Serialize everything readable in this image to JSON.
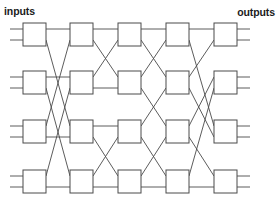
{
  "figure": {
    "type": "network-diagram",
    "name": "benes-switching-network",
    "background_color": "#ffffff",
    "line_color": "#4a4a4a",
    "text_color": "#1b1b1b"
  },
  "labels": {
    "inputs": "inputs",
    "outputs": "outputs"
  },
  "geometry": {
    "canvas_width": 279,
    "canvas_height": 205,
    "box_width": 23,
    "box_height": 23,
    "column_x": [
      23,
      70,
      118,
      166,
      214
    ],
    "row_y": [
      23,
      71,
      120,
      170
    ],
    "port_offset_top": 6,
    "port_offset_bottom": 17,
    "stub_length": 13
  },
  "stages": [
    {
      "index": 1,
      "label": "stage-1",
      "switch_count": 4
    },
    {
      "index": 2,
      "label": "stage-2",
      "switch_count": 4
    },
    {
      "index": 3,
      "label": "stage-3",
      "switch_count": 4
    },
    {
      "index": 4,
      "label": "stage-4",
      "switch_count": 4
    },
    {
      "index": 5,
      "label": "stage-5",
      "switch_count": 4
    }
  ],
  "switches": [
    {
      "id": "sw-1-1",
      "stage": 1,
      "row": 1
    },
    {
      "id": "sw-1-2",
      "stage": 1,
      "row": 2
    },
    {
      "id": "sw-1-3",
      "stage": 1,
      "row": 3
    },
    {
      "id": "sw-1-4",
      "stage": 1,
      "row": 4
    },
    {
      "id": "sw-2-1",
      "stage": 2,
      "row": 1
    },
    {
      "id": "sw-2-2",
      "stage": 2,
      "row": 2
    },
    {
      "id": "sw-2-3",
      "stage": 2,
      "row": 3
    },
    {
      "id": "sw-2-4",
      "stage": 2,
      "row": 4
    },
    {
      "id": "sw-3-1",
      "stage": 3,
      "row": 1
    },
    {
      "id": "sw-3-2",
      "stage": 3,
      "row": 2
    },
    {
      "id": "sw-3-3",
      "stage": 3,
      "row": 3
    },
    {
      "id": "sw-3-4",
      "stage": 3,
      "row": 4
    },
    {
      "id": "sw-4-1",
      "stage": 4,
      "row": 1
    },
    {
      "id": "sw-4-2",
      "stage": 4,
      "row": 2
    },
    {
      "id": "sw-4-3",
      "stage": 4,
      "row": 3
    },
    {
      "id": "sw-4-4",
      "stage": 4,
      "row": 4
    },
    {
      "id": "sw-5-1",
      "stage": 5,
      "row": 1
    },
    {
      "id": "sw-5-2",
      "stage": 5,
      "row": 2
    },
    {
      "id": "sw-5-3",
      "stage": 5,
      "row": 3
    },
    {
      "id": "sw-5-4",
      "stage": 5,
      "row": 4
    }
  ],
  "input_ports": [
    {
      "id": "in-1",
      "row": 1,
      "port": "top"
    },
    {
      "id": "in-2",
      "row": 1,
      "port": "bottom"
    },
    {
      "id": "in-3",
      "row": 2,
      "port": "top"
    },
    {
      "id": "in-4",
      "row": 2,
      "port": "bottom"
    },
    {
      "id": "in-5",
      "row": 3,
      "port": "top"
    },
    {
      "id": "in-6",
      "row": 3,
      "port": "bottom"
    },
    {
      "id": "in-7",
      "row": 4,
      "port": "top"
    },
    {
      "id": "in-8",
      "row": 4,
      "port": "bottom"
    }
  ],
  "output_ports": [
    {
      "id": "out-1",
      "row": 1,
      "port": "top"
    },
    {
      "id": "out-2",
      "row": 1,
      "port": "bottom"
    },
    {
      "id": "out-3",
      "row": 2,
      "port": "top"
    },
    {
      "id": "out-4",
      "row": 2,
      "port": "bottom"
    },
    {
      "id": "out-5",
      "row": 3,
      "port": "top"
    },
    {
      "id": "out-6",
      "row": 3,
      "port": "bottom"
    },
    {
      "id": "out-7",
      "row": 4,
      "port": "top"
    },
    {
      "id": "out-8",
      "row": 4,
      "port": "bottom"
    }
  ],
  "links": [
    {
      "from_stage": 1,
      "from_row": 1,
      "from_port": "top",
      "to_row": 1,
      "to_port": "top"
    },
    {
      "from_stage": 1,
      "from_row": 1,
      "from_port": "bottom",
      "to_row": 3,
      "to_port": "top"
    },
    {
      "from_stage": 1,
      "from_row": 2,
      "from_port": "top",
      "to_row": 2,
      "to_port": "top"
    },
    {
      "from_stage": 1,
      "from_row": 2,
      "from_port": "bottom",
      "to_row": 4,
      "to_port": "top"
    },
    {
      "from_stage": 1,
      "from_row": 3,
      "from_port": "top",
      "to_row": 1,
      "to_port": "bottom"
    },
    {
      "from_stage": 1,
      "from_row": 3,
      "from_port": "bottom",
      "to_row": 3,
      "to_port": "bottom"
    },
    {
      "from_stage": 1,
      "from_row": 4,
      "from_port": "top",
      "to_row": 2,
      "to_port": "bottom"
    },
    {
      "from_stage": 1,
      "from_row": 4,
      "from_port": "bottom",
      "to_row": 4,
      "to_port": "bottom"
    },
    {
      "from_stage": 2,
      "from_row": 1,
      "from_port": "top",
      "to_row": 1,
      "to_port": "top"
    },
    {
      "from_stage": 2,
      "from_row": 1,
      "from_port": "bottom",
      "to_row": 2,
      "to_port": "top"
    },
    {
      "from_stage": 2,
      "from_row": 2,
      "from_port": "top",
      "to_row": 1,
      "to_port": "bottom"
    },
    {
      "from_stage": 2,
      "from_row": 2,
      "from_port": "bottom",
      "to_row": 2,
      "to_port": "bottom"
    },
    {
      "from_stage": 2,
      "from_row": 3,
      "from_port": "top",
      "to_row": 3,
      "to_port": "top"
    },
    {
      "from_stage": 2,
      "from_row": 3,
      "from_port": "bottom",
      "to_row": 4,
      "to_port": "top"
    },
    {
      "from_stage": 2,
      "from_row": 4,
      "from_port": "top",
      "to_row": 3,
      "to_port": "bottom"
    },
    {
      "from_stage": 2,
      "from_row": 4,
      "from_port": "bottom",
      "to_row": 4,
      "to_port": "bottom"
    },
    {
      "from_stage": 3,
      "from_row": 1,
      "from_port": "top",
      "to_row": 1,
      "to_port": "top"
    },
    {
      "from_stage": 3,
      "from_row": 1,
      "from_port": "bottom",
      "to_row": 2,
      "to_port": "top"
    },
    {
      "from_stage": 3,
      "from_row": 2,
      "from_port": "top",
      "to_row": 1,
      "to_port": "bottom"
    },
    {
      "from_stage": 3,
      "from_row": 2,
      "from_port": "bottom",
      "to_row": 3,
      "to_port": "top"
    },
    {
      "from_stage": 3,
      "from_row": 3,
      "from_port": "top",
      "to_row": 2,
      "to_port": "bottom"
    },
    {
      "from_stage": 3,
      "from_row": 3,
      "from_port": "bottom",
      "to_row": 4,
      "to_port": "top"
    },
    {
      "from_stage": 3,
      "from_row": 4,
      "from_port": "top",
      "to_row": 3,
      "to_port": "bottom"
    },
    {
      "from_stage": 3,
      "from_row": 4,
      "from_port": "bottom",
      "to_row": 4,
      "to_port": "bottom"
    },
    {
      "from_stage": 4,
      "from_row": 1,
      "from_port": "top",
      "to_row": 1,
      "to_port": "top"
    },
    {
      "from_stage": 4,
      "from_row": 1,
      "from_port": "bottom",
      "to_row": 3,
      "to_port": "top"
    },
    {
      "from_stage": 4,
      "from_row": 2,
      "from_port": "top",
      "to_row": 1,
      "to_port": "bottom"
    },
    {
      "from_stage": 4,
      "from_row": 2,
      "from_port": "bottom",
      "to_row": 3,
      "to_port": "bottom"
    },
    {
      "from_stage": 4,
      "from_row": 3,
      "from_port": "top",
      "to_row": 2,
      "to_port": "top"
    },
    {
      "from_stage": 4,
      "from_row": 3,
      "from_port": "bottom",
      "to_row": 4,
      "to_port": "top"
    },
    {
      "from_stage": 4,
      "from_row": 4,
      "from_port": "top",
      "to_row": 2,
      "to_port": "bottom"
    },
    {
      "from_stage": 4,
      "from_row": 4,
      "from_port": "bottom",
      "to_row": 4,
      "to_port": "bottom"
    }
  ]
}
